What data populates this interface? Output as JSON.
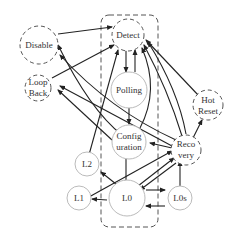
{
  "diagram": {
    "type": "state-machine",
    "colors": {
      "line": "#222222",
      "solid_node_stroke": "#bbbbbb",
      "dashed_node_stroke": "#555555",
      "text": "#333333"
    },
    "nodes": [
      {
        "id": "detect",
        "lines": [
          "Detect"
        ],
        "style": "dashed"
      },
      {
        "id": "polling",
        "lines": [
          "Polling"
        ],
        "style": "solid"
      },
      {
        "id": "configuration",
        "lines": [
          "Config",
          "uration"
        ],
        "style": "solid"
      },
      {
        "id": "recovery",
        "lines": [
          "Reco",
          "very"
        ],
        "style": "dashed"
      },
      {
        "id": "l0",
        "lines": [
          "L0"
        ],
        "style": "solid"
      },
      {
        "id": "l0s",
        "lines": [
          "L0s"
        ],
        "style": "solid"
      },
      {
        "id": "l1",
        "lines": [
          "L1"
        ],
        "style": "solid"
      },
      {
        "id": "l2",
        "lines": [
          "L2"
        ],
        "style": "solid"
      },
      {
        "id": "disable",
        "lines": [
          "Disable"
        ],
        "style": "dashed"
      },
      {
        "id": "loopback",
        "lines": [
          "Loop",
          "Back"
        ],
        "style": "dashed"
      },
      {
        "id": "hotreset",
        "lines": [
          "Hot",
          "Reset"
        ],
        "style": "dashed"
      }
    ],
    "edges": [
      {
        "from": "disable",
        "to": "detect"
      },
      {
        "from": "loopback",
        "to": "detect"
      },
      {
        "from": "detect",
        "to": "polling"
      },
      {
        "from": "polling",
        "to": "detect"
      },
      {
        "from": "polling",
        "to": "configuration"
      },
      {
        "from": "configuration",
        "to": "detect"
      },
      {
        "from": "configuration",
        "to": "disable"
      },
      {
        "from": "configuration",
        "to": "loopback"
      },
      {
        "from": "configuration",
        "to": "l0"
      },
      {
        "from": "recovery",
        "to": "detect"
      },
      {
        "from": "recovery",
        "to": "disable"
      },
      {
        "from": "recovery",
        "to": "loopback"
      },
      {
        "from": "recovery",
        "to": "configuration"
      },
      {
        "from": "recovery",
        "to": "hotreset"
      },
      {
        "from": "recovery",
        "to": "l0"
      },
      {
        "from": "hotreset",
        "to": "detect"
      },
      {
        "from": "l0",
        "to": "recovery"
      },
      {
        "from": "l0",
        "to": "l0s"
      },
      {
        "from": "l0s",
        "to": "l0"
      },
      {
        "from": "l0s",
        "to": "recovery"
      },
      {
        "from": "l0",
        "to": "l1"
      },
      {
        "from": "l1",
        "to": "recovery"
      },
      {
        "from": "l0",
        "to": "l2"
      },
      {
        "from": "l2",
        "to": "detect"
      }
    ],
    "group": {
      "id": "main-path-group",
      "style": "dashed-rounded-rect",
      "members": [
        "detect",
        "polling",
        "configuration",
        "l0"
      ]
    }
  }
}
